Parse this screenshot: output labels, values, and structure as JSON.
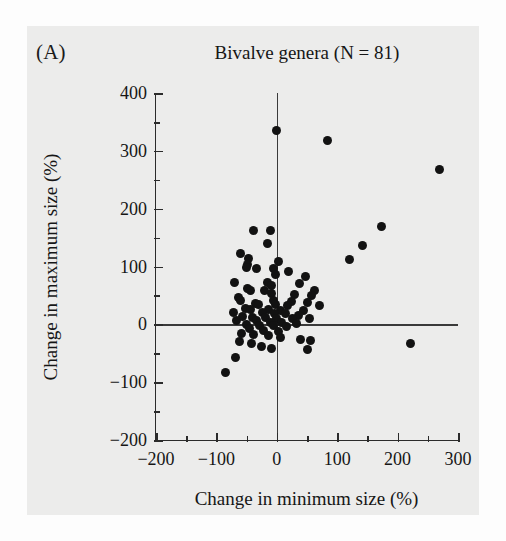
{
  "figure": {
    "panel_label": "(A)",
    "background_color": "#ececeb",
    "ink_color": "#121212"
  },
  "chart_data": {
    "type": "scatter",
    "title": "Bivalve genera (N = 81)",
    "xlabel": "Change in minimum size (%)",
    "ylabel": "Change in maximum size (%)",
    "xlim": [
      -200,
      300
    ],
    "ylim": [
      -200,
      400
    ],
    "xticks": [
      -200,
      -100,
      0,
      100,
      200,
      300
    ],
    "xtick_labels": [
      "−200",
      "−100",
      "0",
      "100",
      "200",
      "300"
    ],
    "yticks": [
      -200,
      -100,
      0,
      100,
      200,
      300,
      400
    ],
    "ytick_labels": [
      "−200",
      "−100",
      "0",
      "100",
      "200",
      "300",
      "400"
    ],
    "minor_tick_step": 50,
    "grid": false,
    "legend": null,
    "reference_lines": [
      {
        "axis": "x",
        "value": 0
      },
      {
        "axis": "y",
        "value": 0
      }
    ],
    "n_points": 81,
    "marker": {
      "shape": "circle",
      "color": "#121212",
      "size_px": 9
    },
    "points": [
      [
        0,
        335
      ],
      [
        84,
        318
      ],
      [
        270,
        268
      ],
      [
        174,
        170
      ],
      [
        -38,
        163
      ],
      [
        -10,
        163
      ],
      [
        -16,
        140
      ],
      [
        142,
        136
      ],
      [
        -60,
        123
      ],
      [
        -47,
        113
      ],
      [
        120,
        112
      ],
      [
        2,
        108
      ],
      [
        -48,
        104
      ],
      [
        -50,
        98
      ],
      [
        -34,
        96
      ],
      [
        -5,
        96
      ],
      [
        20,
        92
      ],
      [
        -2,
        86
      ],
      [
        47,
        82
      ],
      [
        -70,
        72
      ],
      [
        -16,
        72
      ],
      [
        38,
        70
      ],
      [
        -9,
        68
      ],
      [
        -48,
        62
      ],
      [
        -44,
        58
      ],
      [
        -20,
        58
      ],
      [
        62,
        58
      ],
      [
        -8,
        54
      ],
      [
        30,
        52
      ],
      [
        58,
        50
      ],
      [
        -64,
        46
      ],
      [
        -60,
        42
      ],
      [
        -6,
        42
      ],
      [
        24,
        40
      ],
      [
        50,
        38
      ],
      [
        -36,
        36
      ],
      [
        -30,
        34
      ],
      [
        -2,
        34
      ],
      [
        18,
        32
      ],
      [
        70,
        32
      ],
      [
        -52,
        28
      ],
      [
        -44,
        26
      ],
      [
        -14,
        26
      ],
      [
        6,
        24
      ],
      [
        44,
        24
      ],
      [
        -72,
        20
      ],
      [
        -24,
        20
      ],
      [
        -4,
        18
      ],
      [
        14,
        18
      ],
      [
        36,
        16
      ],
      [
        -56,
        14
      ],
      [
        -40,
        12
      ],
      [
        -18,
        12
      ],
      [
        0,
        10
      ],
      [
        26,
        10
      ],
      [
        54,
        10
      ],
      [
        -66,
        6
      ],
      [
        -34,
        6
      ],
      [
        -10,
        4
      ],
      [
        8,
        4
      ],
      [
        32,
        2
      ],
      [
        -50,
        0
      ],
      [
        -28,
        -2
      ],
      [
        -6,
        -2
      ],
      [
        16,
        -4
      ],
      [
        -46,
        -8
      ],
      [
        -22,
        -10
      ],
      [
        2,
        -12
      ],
      [
        -58,
        -16
      ],
      [
        -38,
        -18
      ],
      [
        -14,
        -20
      ],
      [
        6,
        -22
      ],
      [
        40,
        -26
      ],
      [
        56,
        -28
      ],
      [
        -62,
        -30
      ],
      [
        -42,
        -34
      ],
      [
        -26,
        -38
      ],
      [
        -8,
        -42
      ],
      [
        50,
        -44
      ],
      [
        222,
        -34
      ],
      [
        -68,
        -58
      ],
      [
        -85,
        -84
      ]
    ]
  }
}
